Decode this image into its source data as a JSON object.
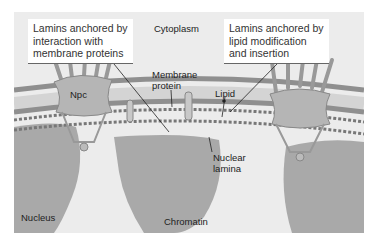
{
  "figure": {
    "callouts": {
      "left": "Lamins anchored by\ninteraction with\nmembrane proteins",
      "right": "Lamins anchored by\nlipid modification\nand insertion"
    },
    "labels": {
      "cytoplasm": "Cytoplasm",
      "membrane_protein_1": "Membrane",
      "membrane_protein_2": "protein",
      "lipid": "Lipid",
      "npc": "Npc",
      "nuclear_lamina_1": "Nuclear",
      "nuclear_lamina_2": "lamina",
      "nucleus": "Nucleus",
      "chromatin": "Chromatin"
    },
    "colors": {
      "background": "#ececec",
      "chromatin": "#a9a9a9",
      "membrane": "#8f8f8f",
      "lamina": "#777777",
      "npc": "#b5b5b5"
    }
  }
}
